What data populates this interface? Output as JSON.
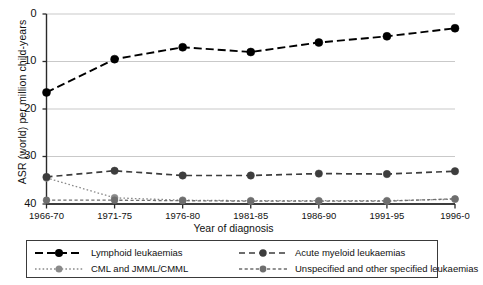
{
  "chart_data": {
    "type": "line",
    "title": "",
    "xlabel": "Year of diagnosis",
    "ylabel": "ASR (world) per million child-years",
    "categories": [
      "1966-70",
      "1971-75",
      "1976-80",
      "1981-85",
      "1986-90",
      "1991-95",
      "1996-0"
    ],
    "ylim": [
      0,
      40
    ],
    "yticks": [
      0,
      10,
      20,
      30,
      40
    ],
    "grid": "horizontal",
    "legend_position": "bottom",
    "series": [
      {
        "name": "Lymphoid leukaemias",
        "values": [
          23.5,
          30.5,
          33.0,
          32.0,
          34.0,
          35.3,
          37.0
        ],
        "color": "#000000",
        "dash": "long-dash",
        "marker": "circle"
      },
      {
        "name": "Acute myeloid leukaemias",
        "values": [
          5.7,
          7.0,
          6.0,
          6.0,
          6.4,
          6.3,
          6.9
        ],
        "color": "#3d3d3d",
        "dash": "dash",
        "marker": "circle"
      },
      {
        "name": "CML and JMML/CMML",
        "values": [
          5.5,
          1.3,
          0.8,
          0.7,
          0.7,
          0.7,
          1.0
        ],
        "color": "#8a8a8a",
        "dash": "dotted",
        "marker": "circle"
      },
      {
        "name": "Unspecified and other specified leukaemias",
        "values": [
          0.8,
          0.8,
          0.7,
          0.6,
          0.6,
          0.6,
          1.1
        ],
        "color": "#6e6e6e",
        "dash": "dash-dot",
        "marker": "circle"
      }
    ]
  },
  "axes": {
    "y_tick_labels": [
      "40",
      "30",
      "20",
      "10",
      "0"
    ],
    "x_tick_labels": [
      "1966-70",
      "1971-75",
      "1976-80",
      "1981-85",
      "1986-90",
      "1991-95",
      "1996-0"
    ],
    "y_title": "ASR (world) per million child-years",
    "x_title": "Year of diagnosis"
  },
  "legend": {
    "entries": [
      {
        "label": "Lymphoid leukaemias"
      },
      {
        "label": "Acute myeloid leukaemias"
      },
      {
        "label": "CML and JMML/CMML"
      },
      {
        "label": "Unspecified and other specified leukaemias"
      }
    ]
  }
}
